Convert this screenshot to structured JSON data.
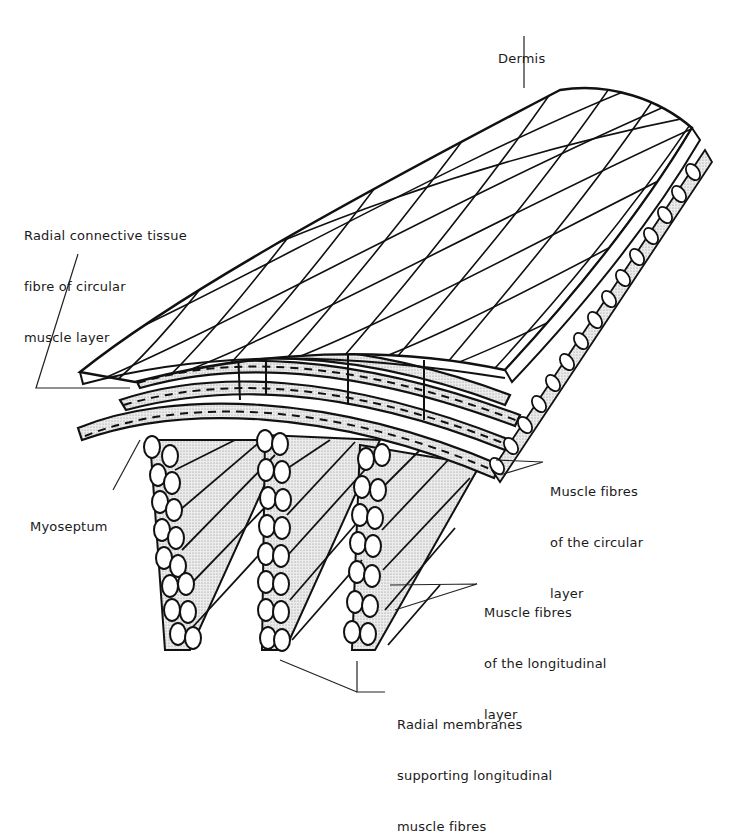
{
  "figure": {
    "labels": {
      "dermis": {
        "lines": [
          "Dermis"
        ]
      },
      "radial_connective": {
        "lines": [
          "Radial connective tissue",
          "fibre of circular",
          "muscle layer"
        ]
      },
      "myoseptum": {
        "lines": [
          "Myoseptum"
        ]
      },
      "circular_fibres": {
        "lines": [
          "Muscle fibres",
          "of the circular",
          "layer"
        ]
      },
      "longitudinal_fibres": {
        "lines": [
          "Muscle fibres",
          "of the longitudinal",
          "layer"
        ]
      },
      "radial_membranes": {
        "lines": [
          "Radial membranes",
          "supporting longitudinal",
          "muscle fibres"
        ]
      }
    },
    "colors": {
      "ink": "#111111",
      "stipple": "#d4d4d4",
      "paper": "#ffffff"
    }
  }
}
